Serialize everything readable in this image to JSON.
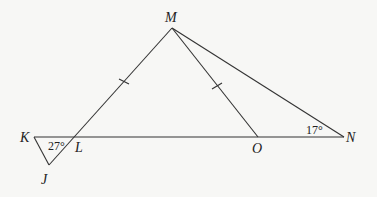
{
  "diagram": {
    "points": {
      "M": {
        "label": "M",
        "x": 172,
        "y": 28
      },
      "K": {
        "label": "K",
        "x": 34,
        "y": 137
      },
      "L": {
        "label": "L",
        "x": 77,
        "y": 137
      },
      "J": {
        "label": "J",
        "x": 49,
        "y": 165
      },
      "O": {
        "label": "O",
        "x": 258,
        "y": 137
      },
      "N": {
        "label": "N",
        "x": 344,
        "y": 137
      }
    },
    "angles": {
      "KLJ": "27°",
      "MNO": "17°"
    },
    "congruent_segments": [
      "ML",
      "MO"
    ]
  }
}
